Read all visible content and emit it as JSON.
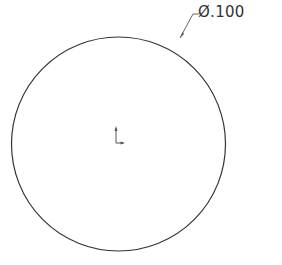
{
  "drawing": {
    "circle": {
      "cx": 118.5,
      "cy": 144,
      "r": 107,
      "stroke": "#333333"
    },
    "dimension": {
      "symbol": "Ø",
      "value": ".100",
      "label": "Ø.100",
      "leader": {
        "start": [
          180,
          38
        ],
        "bend": [
          196,
          14
        ],
        "end": [
          200,
          14
        ]
      }
    },
    "origin_marker": {
      "x": 116,
      "y": 143
    }
  }
}
